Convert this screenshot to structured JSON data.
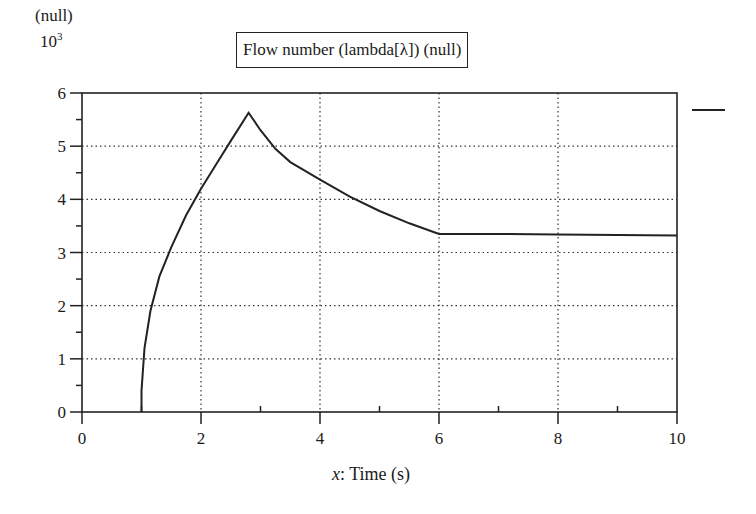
{
  "chart": {
    "unit": "(null)",
    "scale_base": "10",
    "scale_exp": "3",
    "title": "Flow number (lambda[λ]) (null)",
    "xlabel_var": "x",
    "xlabel_text": ": Time (s)",
    "line_color": "#222222"
  },
  "chart_data": {
    "type": "line",
    "title": "Flow number (lambda[λ]) (null)",
    "xlabel": "x: Time (s)",
    "ylabel": "(null) ×10^3",
    "xlim": [
      0,
      10
    ],
    "ylim": [
      0,
      6
    ],
    "x_ticks": [
      "0",
      "2",
      "4",
      "6",
      "8",
      "10"
    ],
    "y_ticks": [
      "0",
      "1",
      "2",
      "3",
      "4",
      "5",
      "6"
    ],
    "grid": true,
    "grid_style": "dotted",
    "legend": {
      "position": "right",
      "entries": [
        ""
      ]
    },
    "series": [
      {
        "name": "",
        "x": [
          1.0,
          1.0,
          1.05,
          1.15,
          1.3,
          1.5,
          1.75,
          2.0,
          2.25,
          2.5,
          2.8,
          3.0,
          3.25,
          3.5,
          4.0,
          4.5,
          5.0,
          5.5,
          6.0,
          7.0,
          8.0,
          9.0,
          10.0
        ],
        "values": [
          0.0,
          0.4,
          1.2,
          1.9,
          2.55,
          3.1,
          3.7,
          4.2,
          4.65,
          5.1,
          5.63,
          5.3,
          4.95,
          4.7,
          4.37,
          4.05,
          3.78,
          3.55,
          3.35,
          3.35,
          3.34,
          3.33,
          3.32
        ]
      }
    ]
  }
}
